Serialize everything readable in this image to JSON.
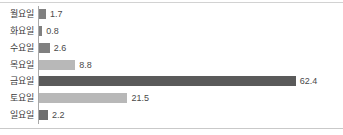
{
  "chart_data": {
    "type": "bar",
    "orientation": "horizontal",
    "title": "",
    "xlabel": "",
    "ylabel": "",
    "categories": [
      "월요일",
      "화요일",
      "수요일",
      "목요일",
      "금요일",
      "토요일",
      "일요일"
    ],
    "values": [
      1.7,
      0.8,
      2.6,
      8.8,
      62.4,
      21.5,
      2.2
    ],
    "value_labels": [
      "1.7",
      "0.8",
      "2.6",
      "8.8",
      "62.4",
      "21.5",
      "2.2"
    ],
    "bar_colors": [
      "#808080",
      "#808080",
      "#808080",
      "#b8b8b8",
      "#5a5a5a",
      "#b8b8b8",
      "#6e6e6e"
    ],
    "xlim": [
      0,
      62.4
    ],
    "grid": false,
    "legend": false,
    "axis_line_color": "#a9a9a9",
    "label_color": "#3b3b3b"
  }
}
